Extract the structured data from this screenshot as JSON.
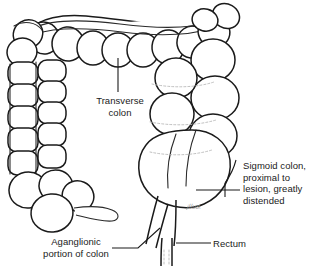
{
  "figure": {
    "background_color": "#ffffff",
    "line_color": "#1a1a1a",
    "fill_color": "#ffffff",
    "shading_color": "#f2f2f2"
  },
  "labels": {
    "transverse": "Transverse\ncolon",
    "sigmoid": "Sigmoid colon,\nproximal to\nlesion, greatly\ndistended",
    "aganglionic": "Aganglionic\nportion of colon",
    "rectum": "Rectum",
    "edge_clip": "e"
  },
  "signature": {
    "text": "artist-signature"
  },
  "anatomy_parts": [
    "transverse-colon",
    "ascending-colon",
    "descending-colon",
    "cecum",
    "appendix",
    "sigmoid-colon",
    "aganglionic-segment",
    "rectum"
  ]
}
